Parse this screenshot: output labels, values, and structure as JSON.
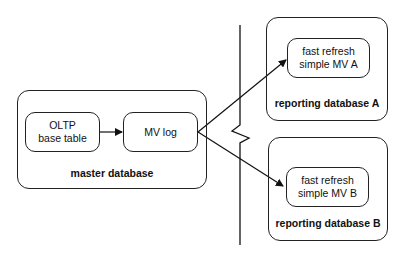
{
  "master": {
    "label": "master database",
    "base_table": {
      "line1": "OLTP",
      "line2": "base table"
    },
    "mv_log": {
      "label": "MV log"
    }
  },
  "reporting_a": {
    "label": "reporting database A",
    "mv": {
      "line1": "fast refresh",
      "line2": "simple MV A"
    }
  },
  "reporting_b": {
    "label": "reporting database B",
    "mv": {
      "line1": "fast refresh",
      "line2": "simple MV B"
    }
  }
}
